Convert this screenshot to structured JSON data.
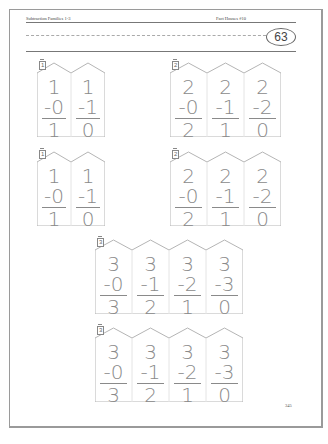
{
  "header": {
    "title": "Subtraction Families 1-3",
    "series": "Fact Houses #10",
    "page_circle": "63"
  },
  "footer": {
    "page_number": "345"
  },
  "houses": [
    {
      "number": "1",
      "columns": [
        {
          "top": "1",
          "sub": "-0",
          "ans": "1"
        },
        {
          "top": "1",
          "sub": "-1",
          "ans": "0"
        }
      ]
    },
    {
      "number": "2",
      "columns": [
        {
          "top": "2",
          "sub": "-0",
          "ans": "2"
        },
        {
          "top": "2",
          "sub": "-1",
          "ans": "1"
        },
        {
          "top": "2",
          "sub": "-2",
          "ans": "0"
        }
      ]
    },
    {
      "number": "1",
      "columns": [
        {
          "top": "1",
          "sub": "-0",
          "ans": "1"
        },
        {
          "top": "1",
          "sub": "-1",
          "ans": "0"
        }
      ]
    },
    {
      "number": "2",
      "columns": [
        {
          "top": "2",
          "sub": "-0",
          "ans": "2"
        },
        {
          "top": "2",
          "sub": "-1",
          "ans": "1"
        },
        {
          "top": "2",
          "sub": "-2",
          "ans": "0"
        }
      ]
    },
    {
      "number": "3",
      "columns": [
        {
          "top": "3",
          "sub": "-0",
          "ans": "3"
        },
        {
          "top": "3",
          "sub": "-1",
          "ans": "2"
        },
        {
          "top": "3",
          "sub": "-2",
          "ans": "1"
        },
        {
          "top": "3",
          "sub": "-3",
          "ans": "0"
        }
      ]
    },
    {
      "number": "3",
      "columns": [
        {
          "top": "3",
          "sub": "-0",
          "ans": "3"
        },
        {
          "top": "3",
          "sub": "-1",
          "ans": "2"
        },
        {
          "top": "3",
          "sub": "-2",
          "ans": "1"
        },
        {
          "top": "3",
          "sub": "-3",
          "ans": "0"
        }
      ]
    }
  ]
}
